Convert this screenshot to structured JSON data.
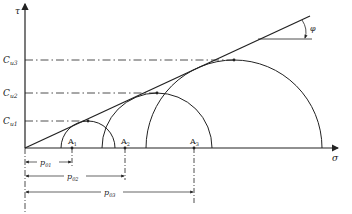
{
  "diagram": {
    "axes": {
      "x_label": "σ",
      "y_label": "τ"
    },
    "angle_label": "φ",
    "cohesion_levels": [
      {
        "label": "C",
        "sub": "u3"
      },
      {
        "label": "C",
        "sub": "u2"
      },
      {
        "label": "C",
        "sub": "u1"
      }
    ],
    "points": [
      {
        "label": "A",
        "sub": "1"
      },
      {
        "label": "A",
        "sub": "2"
      },
      {
        "label": "A",
        "sub": "3"
      }
    ],
    "dimensions": [
      {
        "label": "p",
        "sub": "01"
      },
      {
        "label": "p",
        "sub": "02"
      },
      {
        "label": "p",
        "sub": "03"
      }
    ],
    "colors": {
      "line": "#222222",
      "background": "#ffffff"
    }
  }
}
